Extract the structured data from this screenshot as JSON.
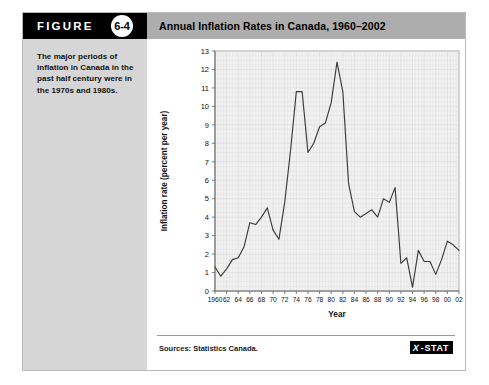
{
  "figure": {
    "label": "FIGURE",
    "number": "6-4",
    "title": "Annual Inflation Rates in Canada, 1960–2002",
    "caption": "The major periods of inflation in Canada in the past half century were in the 1970s and 1980s.",
    "source": "Sources: Statistics Canada.",
    "logo_x": "X",
    "logo_text": "-STAT"
  },
  "colors": {
    "header_tab_bg": "#000000",
    "title_bar_bg": "#adadad",
    "sidebar_bg": "#d6d6d6",
    "plot_bg": "#f2f2f2",
    "grid": "#dcdcdc",
    "line": "#3b3b3b",
    "axis": "#8c8c8c",
    "card_border": "#b9b9b9"
  },
  "chart_data": {
    "type": "line",
    "title": "Annual Inflation Rates in Canada, 1960–2002",
    "xlabel": "Year",
    "ylabel": "Inflation rate (percent per year)",
    "xlim": [
      1960,
      2002
    ],
    "ylim": [
      0,
      13
    ],
    "ytick_values": [
      0,
      1,
      2,
      3,
      4,
      5,
      6,
      7,
      8,
      9,
      10,
      11,
      12,
      13
    ],
    "ytick_labels": [
      "0",
      "1",
      "2",
      "3",
      "4",
      "5",
      "6",
      "7",
      "8",
      "9",
      "10",
      "11",
      "12",
      "13"
    ],
    "xtick_values": [
      1960,
      1962,
      1964,
      1966,
      1968,
      1970,
      1972,
      1974,
      1976,
      1978,
      1980,
      1982,
      1984,
      1986,
      1988,
      1990,
      1992,
      1994,
      1996,
      1998,
      2000,
      2002
    ],
    "xtick_labels": [
      "1960",
      "62",
      "64",
      "66",
      "68",
      "70",
      "72",
      "74",
      "76",
      "78",
      "80",
      "82",
      "84",
      "86",
      "88",
      "90",
      "92",
      "94",
      "96",
      "98",
      "00",
      "02"
    ],
    "grid": true,
    "legend": null,
    "x": [
      1960,
      1961,
      1962,
      1963,
      1964,
      1965,
      1966,
      1967,
      1968,
      1969,
      1970,
      1971,
      1972,
      1973,
      1974,
      1975,
      1976,
      1977,
      1978,
      1979,
      1980,
      1981,
      1982,
      1983,
      1984,
      1985,
      1986,
      1987,
      1988,
      1989,
      1990,
      1991,
      1992,
      1993,
      1994,
      1995,
      1996,
      1997,
      1998,
      1999,
      2000,
      2001,
      2002
    ],
    "values": [
      1.3,
      0.8,
      1.2,
      1.7,
      1.8,
      2.4,
      3.7,
      3.6,
      4.0,
      4.5,
      3.3,
      2.8,
      4.8,
      7.6,
      10.8,
      10.8,
      7.5,
      8.0,
      8.9,
      9.1,
      10.2,
      12.4,
      10.8,
      5.8,
      4.3,
      4.0,
      4.2,
      4.4,
      4.0,
      5.0,
      4.8,
      5.6,
      1.5,
      1.8,
      0.2,
      2.2,
      1.6,
      1.6,
      0.9,
      1.7,
      2.7,
      2.5,
      2.2
    ],
    "series_name": "Inflation rate"
  }
}
